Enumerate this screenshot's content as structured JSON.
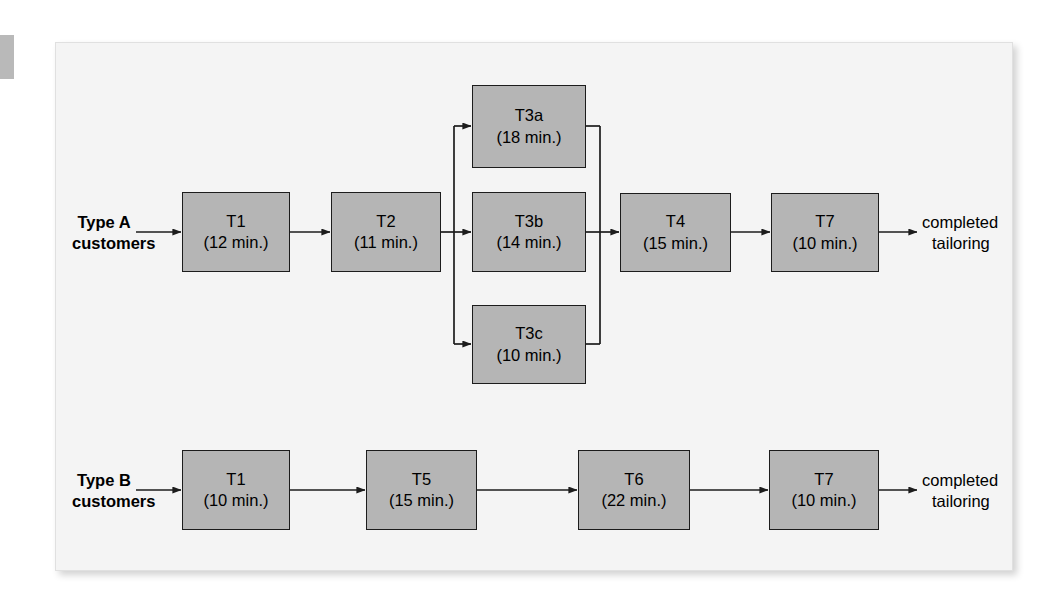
{
  "diagram": {
    "panel_bg": "#f4f4f4",
    "box_fill": "#b5b5b5",
    "box_stroke": "#1c1c1c",
    "line_color": "#1c1c1c"
  },
  "flows": [
    {
      "id": "type-a",
      "entry_label": {
        "line1": "Type A",
        "line2": "customers"
      },
      "exit_label": {
        "line1": "completed",
        "line2": "tailoring"
      },
      "nodes": [
        {
          "id": "a-t1",
          "task": "T1",
          "time": "(12 min.)",
          "minutes": 12
        },
        {
          "id": "a-t2",
          "task": "T2",
          "time": "(11 min.)",
          "minutes": 11
        },
        {
          "id": "a-t3a",
          "task": "T3a",
          "time": "(18 min.)",
          "minutes": 18
        },
        {
          "id": "a-t3b",
          "task": "T3b",
          "time": "(14 min.)",
          "minutes": 14
        },
        {
          "id": "a-t3c",
          "task": "T3c",
          "time": "(10 min.)",
          "minutes": 10
        },
        {
          "id": "a-t4",
          "task": "T4",
          "time": "(15 min.)",
          "minutes": 15
        },
        {
          "id": "a-t7",
          "task": "T7",
          "time": "(10 min.)",
          "minutes": 10
        }
      ]
    },
    {
      "id": "type-b",
      "entry_label": {
        "line1": "Type B",
        "line2": "customers"
      },
      "exit_label": {
        "line1": "completed",
        "line2": "tailoring"
      },
      "nodes": [
        {
          "id": "b-t1",
          "task": "T1",
          "time": "(10 min.)",
          "minutes": 10
        },
        {
          "id": "b-t5",
          "task": "T5",
          "time": "(15 min.)",
          "minutes": 15
        },
        {
          "id": "b-t6",
          "task": "T6",
          "time": "(22 min.)",
          "minutes": 22
        },
        {
          "id": "b-t7",
          "task": "T7",
          "time": "(10 min.)",
          "minutes": 10
        }
      ]
    }
  ]
}
